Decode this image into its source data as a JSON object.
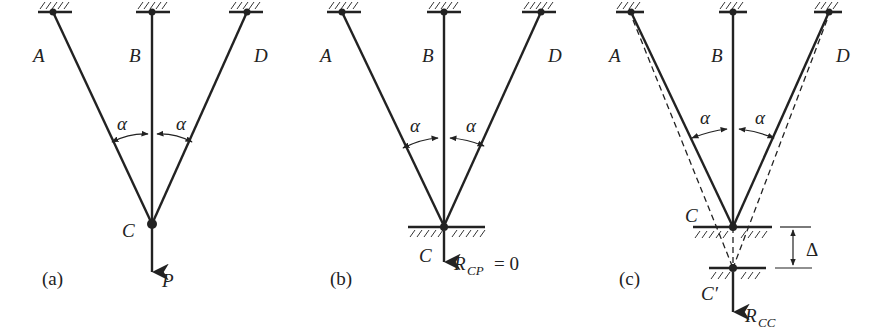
{
  "figure": {
    "panels": [
      {
        "id": "a",
        "caption": "(a)",
        "nodes": {
          "A": "A",
          "B": "B",
          "D": "D",
          "C": "C"
        },
        "angle_left": "α",
        "angle_right": "α",
        "load_label": "P"
      },
      {
        "id": "b",
        "caption": "(b)",
        "nodes": {
          "A": "A",
          "B": "B",
          "D": "D",
          "C": "C"
        },
        "angle_left": "α",
        "angle_right": "α",
        "reaction_main": "R",
        "reaction_sub": "CP",
        "reaction_eq": "= 0"
      },
      {
        "id": "c",
        "caption": "(c)",
        "nodes": {
          "A": "A",
          "B": "B",
          "D": "D",
          "C": "C",
          "Cprime": "C′"
        },
        "angle_left": "α",
        "angle_right": "α",
        "displacement_label": "Δ",
        "reaction_main": "R",
        "reaction_sub": "CC"
      }
    ]
  }
}
